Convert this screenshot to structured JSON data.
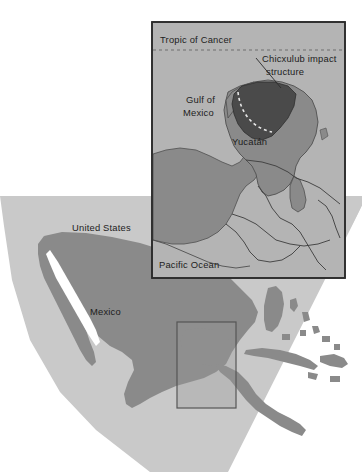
{
  "figure": {
    "kind": "reference-map",
    "title_visible": false
  },
  "palette": {
    "page_background": "#ffffff",
    "ocean_white": "#ffffff",
    "shelf_light_gray": "#c9c9c9",
    "land_mid_gray": "#8a8a8a",
    "inset_background": "#b4b4b4",
    "inset_land": "#8a8a8a",
    "inset_yucatan": "#8a8a8a",
    "crater_dark": "#4a4a4a",
    "frame_stroke": "#2b2b2b",
    "label_text": "#1d1d1d",
    "locator_box_stroke": "#555555"
  },
  "main_map": {
    "name": "regional-locator-map",
    "labels": [
      {
        "id": "united-states",
        "text": "United States",
        "x": 72,
        "y": 231
      },
      {
        "id": "mexico",
        "text": "Mexico",
        "x": 90,
        "y": 315
      }
    ],
    "locator_box": {
      "name": "inset-extent-box",
      "x": 177,
      "y": 322,
      "width": 59,
      "height": 86,
      "note": "rectangle on main map marking the area enlarged in the inset"
    }
  },
  "inset_map": {
    "name": "yucatan-detail-inset",
    "frame": {
      "x": 152,
      "y": 22,
      "width": 193,
      "height": 256
    },
    "labels": [
      {
        "id": "tropic-of-cancer",
        "text": "Tropic of Cancer",
        "x": 160,
        "y": 43
      },
      {
        "id": "gulf-of-mexico-line1",
        "text": "Gulf of",
        "x": 186,
        "y": 103
      },
      {
        "id": "gulf-of-mexico-line2",
        "text": "Mexico",
        "x": 183,
        "y": 116
      },
      {
        "id": "chicxulub-line1",
        "text": "Chicxulub impact",
        "x": 262,
        "y": 62
      },
      {
        "id": "chicxulub-line2",
        "text": "structure",
        "x": 266,
        "y": 75
      },
      {
        "id": "yucatan",
        "text": "Yucatán",
        "x": 232,
        "y": 145
      },
      {
        "id": "pacific-ocean",
        "text": "Pacific Ocean",
        "x": 159,
        "y": 268
      }
    ],
    "tropic_line": {
      "name": "tropic-of-cancer-line",
      "style": "dashed",
      "y": 50,
      "x_start": 153,
      "x_end": 344
    },
    "leader_line": {
      "name": "chicxulub-leader-line",
      "from": {
        "x": 256,
        "y": 60
      },
      "to": {
        "x": 281,
        "y": 88
      }
    },
    "crater": {
      "name": "chicxulub-impact-structure",
      "fill": "#4a4a4a",
      "rim_style": "dashed-arc",
      "note": "dark polygon with dashed semicircular crater rim arc"
    }
  }
}
